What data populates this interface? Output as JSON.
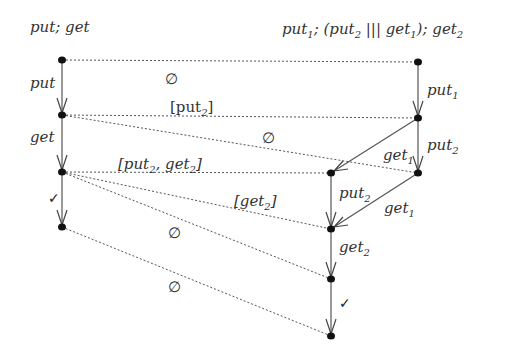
{
  "titles": {
    "left": "put; get",
    "right_parts": [
      "put",
      "1",
      "; (put",
      "2",
      " ||| get",
      "1",
      "); get",
      "2"
    ]
  },
  "left_process": {
    "nodes": [
      {
        "id": "L0",
        "x": 62,
        "y": 60
      },
      {
        "id": "L1",
        "x": 62,
        "y": 115
      },
      {
        "id": "L2",
        "x": 62,
        "y": 172
      },
      {
        "id": "L3",
        "x": 62,
        "y": 227
      }
    ],
    "edges": [
      {
        "from": "L0",
        "to": "L1",
        "label": "put",
        "sub": ""
      },
      {
        "from": "L1",
        "to": "L2",
        "label": "get",
        "sub": ""
      },
      {
        "from": "L2",
        "to": "L3",
        "label": "✓",
        "sub": ""
      }
    ]
  },
  "right_process": {
    "nodes": [
      {
        "id": "R0",
        "x": 418,
        "y": 62
      },
      {
        "id": "R1",
        "x": 418,
        "y": 118
      },
      {
        "id": "R2",
        "x": 418,
        "y": 173
      },
      {
        "id": "M0",
        "x": 331,
        "y": 173
      },
      {
        "id": "M1",
        "x": 331,
        "y": 229
      },
      {
        "id": "M2",
        "x": 331,
        "y": 279
      },
      {
        "id": "M3",
        "x": 331,
        "y": 336
      }
    ],
    "edges": [
      {
        "from": "R0",
        "to": "R1",
        "label": "put",
        "sub": "1"
      },
      {
        "from": "R1",
        "to": "R2",
        "label": "put",
        "sub": "2"
      },
      {
        "from": "R1",
        "to": "M0",
        "label": "get",
        "sub": "1"
      },
      {
        "from": "M0",
        "to": "M1",
        "label": "put",
        "sub": "2"
      },
      {
        "from": "R2",
        "to": "M1",
        "label": "get",
        "sub": "1"
      },
      {
        "from": "M1",
        "to": "M2",
        "label": "get",
        "sub": "2"
      },
      {
        "from": "M2",
        "to": "M3",
        "label": "✓",
        "sub": ""
      }
    ]
  },
  "relations": [
    {
      "from": "L0",
      "to": "R0",
      "label": "∅"
    },
    {
      "from": "L1",
      "to": "R1",
      "label": "[put₂]"
    },
    {
      "from": "L1",
      "to": "R2",
      "label": "∅"
    },
    {
      "from": "L2",
      "to": "M0",
      "label": "[put₂, get₂]"
    },
    {
      "from": "L2",
      "to": "M1",
      "label": "[get₂]"
    },
    {
      "from": "L2",
      "to": "M2",
      "label": "∅"
    },
    {
      "from": "L3",
      "to": "M3",
      "label": "∅"
    }
  ],
  "labels": {
    "put": "put",
    "get": "get",
    "put1": "put",
    "put2": "put",
    "get1": "get",
    "get2": "get",
    "sub1": "1",
    "sub2": "2",
    "check": "✓",
    "empty": "∅",
    "rel_put2_open": "[put",
    "rel_put2_sub": "2",
    "rel_put2_close": "]",
    "rel_putget_a": "[put",
    "rel_putget_sub_a": "2",
    "rel_putget_b": ", get",
    "rel_putget_sub_b": "2",
    "rel_putget_close": "]",
    "rel_get2_open": "[get",
    "rel_get2_sub": "2",
    "rel_get2_close": "]"
  }
}
